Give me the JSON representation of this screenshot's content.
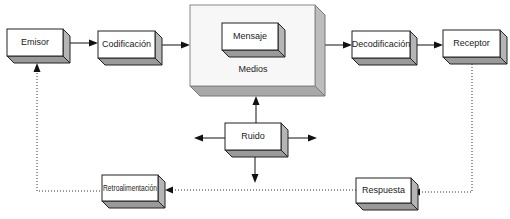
{
  "diagram": {
    "type": "communication-process",
    "nodes": {
      "emisor": {
        "label": "Emisor"
      },
      "codificacion": {
        "label": "Codificación"
      },
      "medios": {
        "label": "Medios"
      },
      "mensaje": {
        "label": "Mensaje"
      },
      "decodificacion": {
        "label": "Decodificación"
      },
      "receptor": {
        "label": "Receptor"
      },
      "ruido": {
        "label": "Ruido"
      },
      "respuesta": {
        "label": "Respuesta"
      },
      "retroalimentacion": {
        "label": "Retroalimentación"
      }
    },
    "edges": [
      {
        "from": "Emisor",
        "to": "Codificación",
        "style": "solid"
      },
      {
        "from": "Codificación",
        "to": "Medios",
        "style": "solid"
      },
      {
        "from": "Medios",
        "to": "Decodificación",
        "style": "solid"
      },
      {
        "from": "Decodificación",
        "to": "Receptor",
        "style": "solid"
      },
      {
        "from": "Ruido",
        "to": "Medios",
        "style": "solid"
      },
      {
        "from": "Ruido",
        "to": "left",
        "style": "solid"
      },
      {
        "from": "Ruido",
        "to": "right",
        "style": "solid"
      },
      {
        "from": "Ruido",
        "to": "down",
        "style": "solid"
      },
      {
        "from": "Receptor",
        "to": "Respuesta",
        "style": "dotted"
      },
      {
        "from": "Respuesta",
        "to": "Retroalimentación",
        "style": "dotted"
      },
      {
        "from": "Retroalimentación",
        "to": "Emisor",
        "style": "dotted"
      }
    ],
    "colors": {
      "box_face": "#ffffff",
      "box_shadow_bottom": "#9a9a9a",
      "box_shadow_side": "#b5b5b5",
      "line": "#111111"
    }
  }
}
